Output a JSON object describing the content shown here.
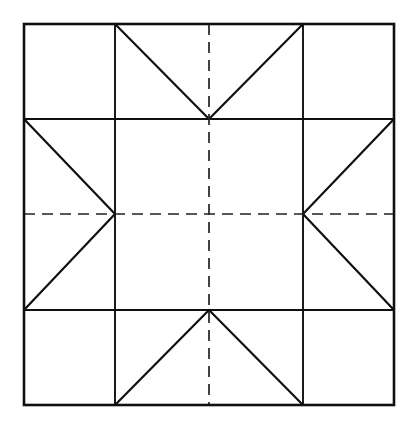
{
  "figure": {
    "type": "geometric-line-diagram",
    "canvas": {
      "width": 416,
      "height": 428,
      "background": "#ffffff"
    },
    "colors": {
      "line": "#101010",
      "dashed_axis": "#222222",
      "fill": "#ffffff"
    },
    "stroke": {
      "outer_border_width": 2.6,
      "grid_line_width": 1.9,
      "diagonal_width": 2.2,
      "dashed_width": 1.7,
      "dash_pattern": "11 7"
    },
    "geometry": {
      "outer_square": {
        "left": 24,
        "top": 24,
        "right": 394,
        "bottom": 405
      },
      "vertical_grid_x": [
        115,
        303
      ],
      "horizontal_grid_y": [
        119,
        310
      ],
      "center": {
        "x": 209,
        "y": 214
      }
    },
    "cells": [
      {
        "name": "top-left",
        "contents": "empty"
      },
      {
        "name": "top-center",
        "contents": "v-shape-two-triangles"
      },
      {
        "name": "top-right",
        "contents": "empty"
      },
      {
        "name": "middle-left",
        "contents": "right-pointing-two-triangles"
      },
      {
        "name": "center",
        "contents": "empty"
      },
      {
        "name": "middle-right",
        "contents": "left-pointing-two-triangles"
      },
      {
        "name": "bottom-left",
        "contents": "empty"
      },
      {
        "name": "bottom-center",
        "contents": "caret-up-two-triangles"
      },
      {
        "name": "bottom-right",
        "contents": "empty"
      }
    ],
    "axes": {
      "vertical_dashed": {
        "x": 209,
        "from_y": 24,
        "to_y": 405
      },
      "horizontal_dashed": {
        "y": 214,
        "from_x": 24,
        "to_x": 394
      }
    },
    "labels": []
  },
  "chart_data": {
    "type": "diagram",
    "title": "",
    "xlabel": "",
    "ylabel": "",
    "segments": [
      {
        "name": "outer-top",
        "x1": 24,
        "y1": 24,
        "x2": 394,
        "y2": 24,
        "style": "solid"
      },
      {
        "name": "outer-bottom",
        "x1": 24,
        "y1": 405,
        "x2": 394,
        "y2": 405,
        "style": "solid"
      },
      {
        "name": "outer-left",
        "x1": 24,
        "y1": 24,
        "x2": 24,
        "y2": 405,
        "style": "solid"
      },
      {
        "name": "outer-right",
        "x1": 394,
        "y1": 24,
        "x2": 394,
        "y2": 405,
        "style": "solid"
      },
      {
        "name": "grid-vertical-left",
        "x1": 115,
        "y1": 24,
        "x2": 115,
        "y2": 405,
        "style": "solid"
      },
      {
        "name": "grid-vertical-right",
        "x1": 303,
        "y1": 24,
        "x2": 303,
        "y2": 405,
        "style": "solid"
      },
      {
        "name": "grid-horizontal-upper",
        "x1": 24,
        "y1": 119,
        "x2": 394,
        "y2": 119,
        "style": "solid"
      },
      {
        "name": "grid-horizontal-lower",
        "x1": 24,
        "y1": 310,
        "x2": 394,
        "y2": 310,
        "style": "solid"
      },
      {
        "name": "top-center-diag-left",
        "x1": 115,
        "y1": 24,
        "x2": 209,
        "y2": 119,
        "style": "solid"
      },
      {
        "name": "top-center-diag-right",
        "x1": 303,
        "y1": 24,
        "x2": 209,
        "y2": 119,
        "style": "solid"
      },
      {
        "name": "bottom-center-diag-left",
        "x1": 115,
        "y1": 405,
        "x2": 209,
        "y2": 310,
        "style": "solid"
      },
      {
        "name": "bottom-center-diag-right",
        "x1": 303,
        "y1": 405,
        "x2": 209,
        "y2": 310,
        "style": "solid"
      },
      {
        "name": "middle-left-diag-upper",
        "x1": 24,
        "y1": 119,
        "x2": 115,
        "y2": 214,
        "style": "solid"
      },
      {
        "name": "middle-left-diag-lower",
        "x1": 24,
        "y1": 310,
        "x2": 115,
        "y2": 214,
        "style": "solid"
      },
      {
        "name": "middle-right-diag-upper",
        "x1": 394,
        "y1": 119,
        "x2": 303,
        "y2": 214,
        "style": "solid"
      },
      {
        "name": "middle-right-diag-lower",
        "x1": 394,
        "y1": 310,
        "x2": 303,
        "y2": 214,
        "style": "solid"
      },
      {
        "name": "axis-vertical",
        "x1": 209,
        "y1": 24,
        "x2": 209,
        "y2": 405,
        "style": "dashed"
      },
      {
        "name": "axis-horizontal",
        "x1": 24,
        "y1": 214,
        "x2": 394,
        "y2": 214,
        "style": "dashed"
      }
    ]
  }
}
